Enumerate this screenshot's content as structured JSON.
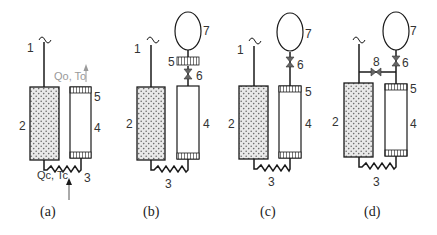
{
  "colors": {
    "line": "#1a1a1a",
    "porous_fill": "#e8e8e8",
    "porous_dot": "#6b6b6b",
    "outlet_gray": "#9a9a9a",
    "text": "#333333"
  },
  "panels": [
    {
      "id": "a",
      "caption": "(a)",
      "labels": {
        "n1": "1",
        "n2": "2",
        "n3": "3",
        "n4": "4",
        "n5": "5"
      },
      "inlet": "Qc, Tc",
      "outlet": "Qo, To"
    },
    {
      "id": "b",
      "caption": "(b)",
      "labels": {
        "n1": "1",
        "n2": "2",
        "n3": "3",
        "n4": "4",
        "n5": "5",
        "n6": "6",
        "n7": "7"
      }
    },
    {
      "id": "c",
      "caption": "(c)",
      "labels": {
        "n1": "1",
        "n2": "2",
        "n3": "3",
        "n4": "4",
        "n5": "5",
        "n6": "6",
        "n7": "7"
      }
    },
    {
      "id": "d",
      "caption": "(d)",
      "labels": {
        "n2": "2",
        "n3": "3",
        "n4": "4",
        "n5": "5",
        "n6": "6",
        "n7": "7",
        "n8": "8"
      }
    }
  ]
}
